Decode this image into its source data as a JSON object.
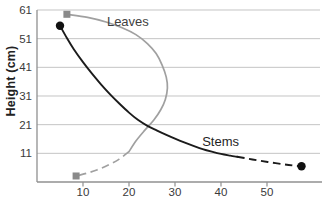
{
  "chart_data": {
    "type": "line",
    "title": "",
    "xlabel": "",
    "ylabel": "Height (cm)",
    "xlim": [
      0,
      62
    ],
    "ylim": [
      1,
      61
    ],
    "x_ticks": [
      10,
      20,
      30,
      40,
      50
    ],
    "y_ticks": [
      11,
      21,
      31,
      41,
      51,
      61
    ],
    "gridlines_at": [
      11,
      21,
      31,
      41,
      51,
      61
    ],
    "grid": "horizontal",
    "legend": "inline-labels",
    "series": [
      {
        "name": "Leaves",
        "color": "#a0a0a0",
        "line_style": "solid-then-dashed",
        "marker": "square",
        "marker_color": "#8a8a8a",
        "label_color": "#3f3f3f",
        "label_pos": [
          15.2,
          59.5
        ],
        "solid_points": [
          [
            6.5,
            59.5
          ],
          [
            11,
            58.4
          ],
          [
            15,
            56.8
          ],
          [
            18.5,
            54.8
          ],
          [
            21.5,
            52.4
          ],
          [
            24,
            49.3
          ],
          [
            25.9,
            45.8
          ],
          [
            27.2,
            41.8
          ],
          [
            28.1,
            37.6
          ],
          [
            28.35,
            33.8
          ],
          [
            27.9,
            29.8
          ],
          [
            26.9,
            26.2
          ],
          [
            25.4,
            22.6
          ],
          [
            23.4,
            19.0
          ],
          [
            21.5,
            15.3
          ],
          [
            20,
            11.6
          ]
        ],
        "dashed_points": [
          [
            20,
            11.6
          ],
          [
            17.8,
            8.9
          ],
          [
            15.5,
            6.9
          ],
          [
            13,
            5.2
          ],
          [
            10.7,
            4.0
          ],
          [
            8.5,
            3.1
          ]
        ],
        "markers_at": [
          [
            6.5,
            59.5
          ],
          [
            8.5,
            3.1
          ]
        ]
      },
      {
        "name": "Stems",
        "color": "#1b1b1b",
        "line_style": "solid-then-dashed",
        "marker": "circle",
        "marker_color": "#111111",
        "label_color": "#1f1f1f",
        "label_pos": [
          35.9,
          17.6
        ],
        "solid_points": [
          [
            5,
            55.5
          ],
          [
            6.5,
            51.2
          ],
          [
            8,
            47.3
          ],
          [
            10,
            42.8
          ],
          [
            12,
            38.7
          ],
          [
            14,
            34.9
          ],
          [
            16,
            31.4
          ],
          [
            18,
            28.2
          ],
          [
            20,
            25.2
          ],
          [
            22,
            22.6
          ],
          [
            24,
            20.6
          ],
          [
            26,
            19.0
          ],
          [
            28,
            17.5
          ],
          [
            30,
            16.1
          ],
          [
            32,
            14.8
          ],
          [
            34,
            13.6
          ],
          [
            36,
            12.5
          ],
          [
            38,
            11.6
          ],
          [
            40,
            10.8
          ],
          [
            42,
            10.2
          ],
          [
            43.5,
            9.8
          ]
        ],
        "dashed_points": [
          [
            43.5,
            9.8
          ],
          [
            46,
            9.1
          ],
          [
            48.5,
            8.4
          ],
          [
            51,
            7.8
          ],
          [
            53.5,
            7.2
          ],
          [
            55.5,
            6.8
          ],
          [
            57.5,
            6.5
          ]
        ],
        "markers_at": [
          [
            5,
            55.5
          ],
          [
            57.5,
            6.5
          ]
        ]
      }
    ]
  },
  "colors": {
    "background": "#ffffff",
    "gridline": "#c4c4c4",
    "axis": "#909090",
    "tick_text": "#3a3a3a"
  }
}
